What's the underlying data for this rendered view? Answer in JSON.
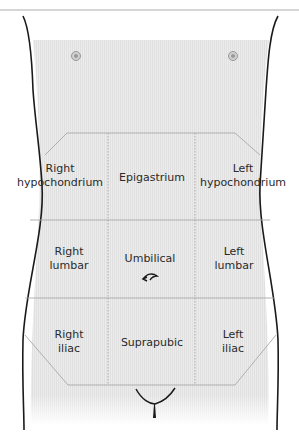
{
  "figure": {
    "colors": {
      "skin_shade": "#e9e9e9",
      "outline": "#1a1a1a",
      "grid_line": "#a8a8a8",
      "top_rule": "#c8c8c8",
      "text": "#2a2a2a"
    },
    "regions": [
      {
        "id": "right-hypochondrium",
        "line1": "Right",
        "line2": "hypochondrium"
      },
      {
        "id": "epigastrium",
        "line1": "Epigastrium",
        "line2": ""
      },
      {
        "id": "left-hypochondrium",
        "line1": "Left",
        "line2": "hypochondrium"
      },
      {
        "id": "right-lumbar",
        "line1": "Right",
        "line2": "lumbar"
      },
      {
        "id": "umbilical",
        "line1": "Umbilical",
        "line2": ""
      },
      {
        "id": "left-lumbar",
        "line1": "Left",
        "line2": "lumbar"
      },
      {
        "id": "right-iliac",
        "line1": "Right",
        "line2": "iliac"
      },
      {
        "id": "suprapubic",
        "line1": "Suprapubic",
        "line2": ""
      },
      {
        "id": "left-iliac",
        "line1": "Left",
        "line2": "iliac"
      }
    ],
    "landmarks": [
      "right-nipple-icon",
      "left-nipple-icon",
      "navel-icon",
      "pubic-line-icon"
    ]
  }
}
